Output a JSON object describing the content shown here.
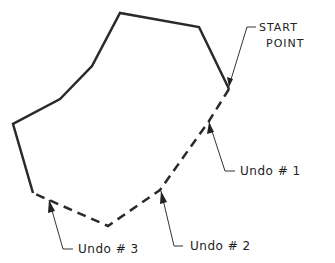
{
  "diagram": {
    "labels": {
      "start_point_line1": "START",
      "start_point_line2": "POINT",
      "undo1": "Undo # 1",
      "undo2": "Undo # 2",
      "undo3": "Undo # 3"
    },
    "colors": {
      "line": "#2a2a2a",
      "leader": "#333333",
      "background": "#ffffff"
    }
  }
}
